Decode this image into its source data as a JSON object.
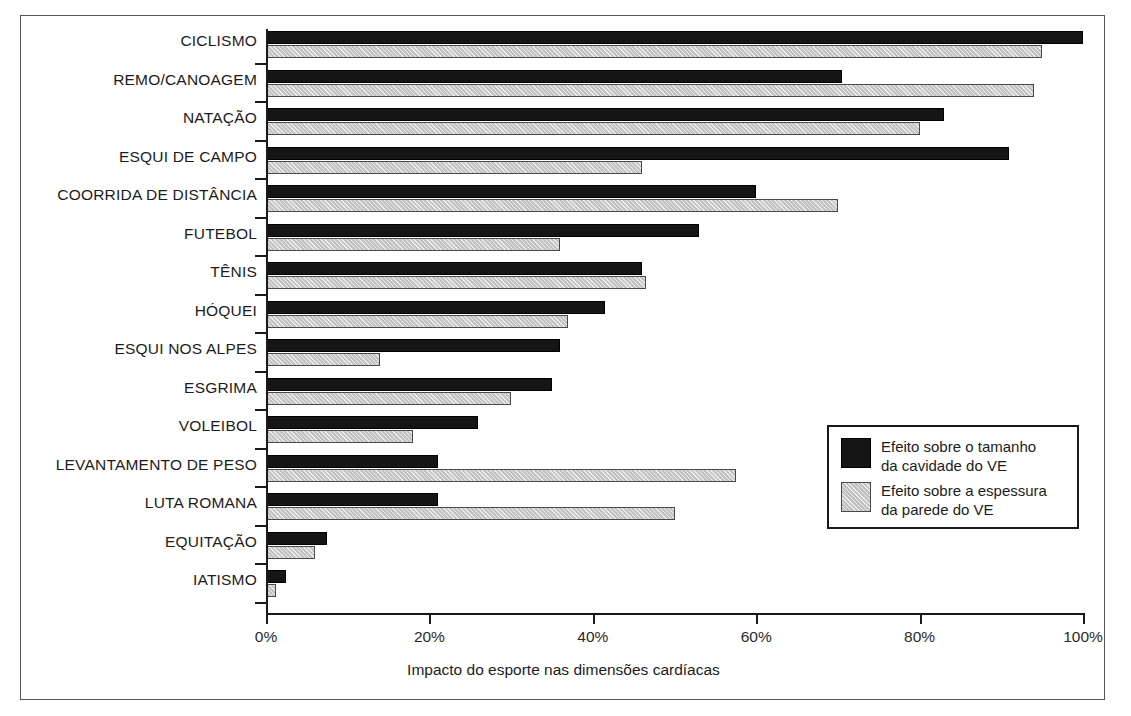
{
  "chart_data": {
    "type": "bar",
    "orientation": "horizontal",
    "title": "",
    "xlabel": "Impacto do esporte nas dimensões cardíacas",
    "ylabel": "",
    "xlim": [
      0,
      100
    ],
    "xticks": [
      "0%",
      "20%",
      "40%",
      "60%",
      "80%",
      "100%"
    ],
    "xtick_values": [
      0,
      20,
      40,
      60,
      80,
      100
    ],
    "grid": false,
    "legend_position": "center-right",
    "categories": [
      "CICLISMO",
      "REMO/CANOAGEM",
      "NATAÇÃO",
      "ESQUI DE CAMPO",
      "COORRIDA DE DISTÂNCIA",
      "FUTEBOL",
      "TÊNIS",
      "HÓQUEI",
      "ESQUI NOS ALPES",
      "ESGRIMA",
      "VOLEIBOL",
      "LEVANTAMENTO DE PESO",
      "LUTA ROMANA",
      "EQUITAÇÃO",
      "IATISMO"
    ],
    "series": [
      {
        "name": "Efeito sobre o tamanho\nda cavidade do VE",
        "color": "#151515",
        "values": [
          100,
          70.5,
          83,
          91,
          60,
          53,
          46,
          41.5,
          36,
          35,
          26,
          21,
          21,
          7.5,
          2.5
        ]
      },
      {
        "name": "Efeito sobre a espessura\nda parede do VE",
        "color": "#d2d2d2",
        "values": [
          95,
          94,
          80,
          46,
          70,
          36,
          46.5,
          37,
          14,
          30,
          18,
          57.5,
          50,
          6,
          1.2
        ]
      }
    ]
  },
  "legend": {
    "items": [
      {
        "label": "Efeito sobre o tamanho\nda cavidade do VE",
        "swatch": "dark"
      },
      {
        "label": "Efeito sobre a espessura\nda parede do VE",
        "swatch": "light"
      }
    ]
  }
}
